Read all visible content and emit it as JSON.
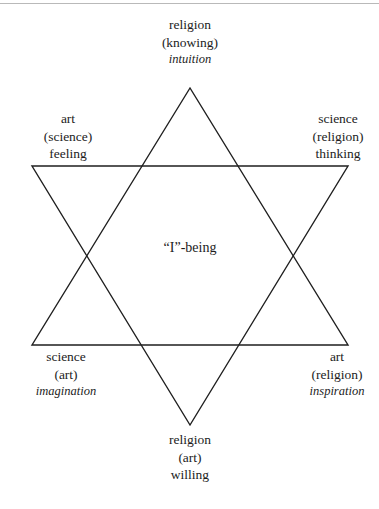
{
  "diagram": {
    "type": "hexagram",
    "center_label": "“I”-being",
    "stroke_color": "#1f1f1f",
    "background_color": "#ffffff",
    "top_rule_color": "#b9b9b9",
    "vertices": [
      {
        "name": "top",
        "x": 190,
        "y": 88
      },
      {
        "name": "upper-left",
        "x": 32,
        "y": 166
      },
      {
        "name": "upper-right",
        "x": 348,
        "y": 166
      },
      {
        "name": "lower-left",
        "x": 32,
        "y": 345
      },
      {
        "name": "lower-right",
        "x": 348,
        "y": 345
      },
      {
        "name": "bottom",
        "x": 190,
        "y": 425
      }
    ],
    "triangle_up": "190,88 32,345 348,345",
    "triangle_down": "32,166 348,166 190,425"
  },
  "labels": {
    "top": {
      "role": "religion",
      "paren": "(knowing)",
      "faculty": "intuition",
      "faculty_italic": true
    },
    "left": {
      "role": "art",
      "paren": "(science)",
      "faculty": "feeling",
      "faculty_italic": false
    },
    "right": {
      "role": "science",
      "paren": "(religion)",
      "faculty": "thinking",
      "faculty_italic": false
    },
    "bottom_left": {
      "role": "science",
      "paren": "(art)",
      "faculty": "imagination",
      "faculty_italic": true
    },
    "bottom_right": {
      "role": "art",
      "paren": "(religion)",
      "faculty": "inspiration",
      "faculty_italic": true
    },
    "bottom": {
      "role": "religion",
      "paren": "(art)",
      "faculty": "willing",
      "faculty_italic": false
    }
  }
}
